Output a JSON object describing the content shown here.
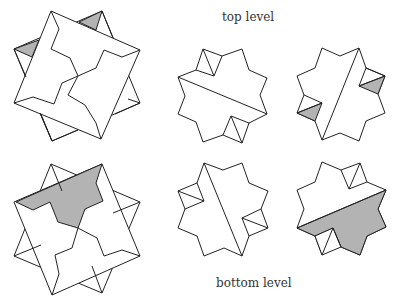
{
  "labels": {
    "top": "top level",
    "bottom": "bottom level"
  },
  "colors": {
    "stroke": "#222222",
    "shade": "#b3b3b3",
    "background": "#ffffff"
  },
  "figures": [
    {
      "id": "top-overlay",
      "row": "top",
      "col": 1,
      "description": "two overlapping squares with zig-zag cut path, shaded small triangles at top"
    },
    {
      "id": "top-piece-a",
      "row": "top",
      "col": 2,
      "description": "eight-pointed star with diagonal cut, two unshaded corner triangles"
    },
    {
      "id": "top-piece-b",
      "row": "top",
      "col": 3,
      "description": "eight-pointed star with diagonal cut, two shaded triangles"
    },
    {
      "id": "bottom-overlay",
      "row": "bottom",
      "col": 1,
      "description": "two overlapping squares with shaded region at top"
    },
    {
      "id": "bottom-piece-a",
      "row": "bottom",
      "col": 2,
      "description": "eight-pointed star with diagonal cut, two unshaded side triangles"
    },
    {
      "id": "bottom-piece-b",
      "row": "bottom",
      "col": 3,
      "description": "eight-pointed star with lower half shaded"
    }
  ]
}
